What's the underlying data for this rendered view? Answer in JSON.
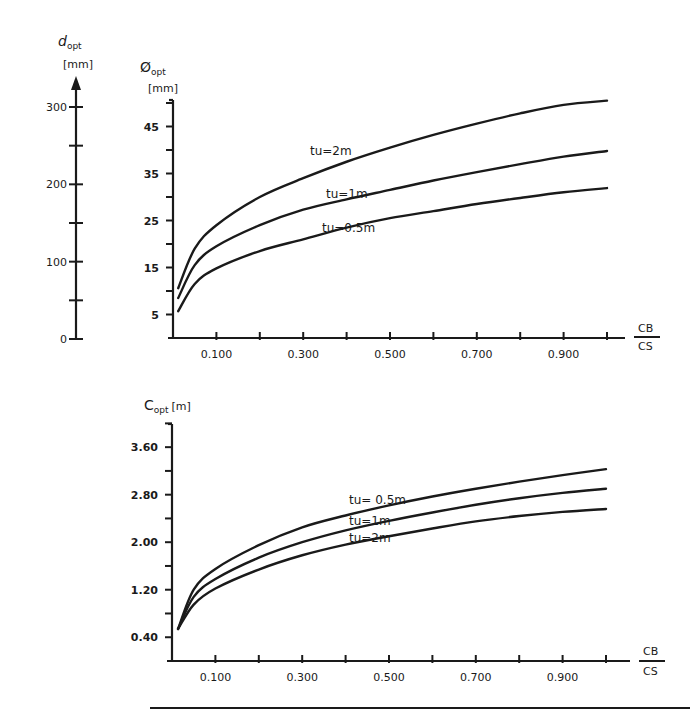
{
  "chart_data": [
    {
      "type": "line",
      "title": "",
      "xlabel": "C_B / C_S",
      "ylabel": "Ø_opt [mm]",
      "secondary_ylabel": "d_opt [mm]",
      "secondary_yticks": [
        "0",
        "100",
        "200",
        "300"
      ],
      "secondary_ylim": [
        0,
        300
      ],
      "xticks": [
        "0.100",
        "0.300",
        "0.500",
        "0.700",
        "0.900"
      ],
      "yticks": [
        "5",
        "15",
        "25",
        "35",
        "45"
      ],
      "xlim": [
        0,
        1.0
      ],
      "ylim": [
        0,
        50
      ],
      "grid": false,
      "legend": "inline curve labels",
      "x": [
        0.012,
        0.05,
        0.1,
        0.2,
        0.3,
        0.4,
        0.5,
        0.6,
        0.7,
        0.8,
        0.9,
        1.0
      ],
      "series": [
        {
          "name": "tu=2m",
          "label": "tu=2m",
          "values": [
            10.6,
            19.0,
            24.0,
            30.0,
            34.0,
            37.5,
            40.5,
            43.2,
            45.6,
            47.8,
            49.6,
            50.5
          ]
        },
        {
          "name": "tu=1m",
          "label": "tu=1m",
          "values": [
            8.5,
            15.5,
            19.5,
            24.0,
            27.3,
            29.5,
            31.5,
            33.5,
            35.3,
            37.0,
            38.6,
            39.8
          ]
        },
        {
          "name": "tu=0.5m",
          "label": "tu=0.5m",
          "values": [
            5.7,
            11.5,
            14.8,
            18.5,
            21.0,
            23.5,
            25.5,
            27.0,
            28.5,
            29.8,
            31.0,
            31.9
          ]
        }
      ]
    },
    {
      "type": "line",
      "title": "",
      "xlabel": "C_B / C_S",
      "ylabel": "C_opt [m]",
      "xticks": [
        "0.100",
        "0.300",
        "0.500",
        "0.700",
        "0.900"
      ],
      "yticks": [
        "0.40",
        "1.20",
        "2.00",
        "2.80",
        "3.60"
      ],
      "xlim": [
        0,
        1.0
      ],
      "ylim": [
        0,
        4.0
      ],
      "grid": false,
      "legend": "inline curve labels",
      "x": [
        0.014,
        0.05,
        0.1,
        0.2,
        0.3,
        0.4,
        0.5,
        0.6,
        0.7,
        0.8,
        0.9,
        1.0
      ],
      "series": [
        {
          "name": "tu=0.5m",
          "label": "tu= 0.5m",
          "values": [
            0.54,
            1.2,
            1.55,
            1.95,
            2.25,
            2.45,
            2.62,
            2.77,
            2.9,
            3.02,
            3.13,
            3.23
          ]
        },
        {
          "name": "tu=1m",
          "label": "tu=1m",
          "values": [
            0.54,
            1.08,
            1.38,
            1.74,
            2.0,
            2.2,
            2.36,
            2.5,
            2.63,
            2.74,
            2.83,
            2.9
          ]
        },
        {
          "name": "tu=2m",
          "label": "tu=2m",
          "values": [
            0.54,
            0.95,
            1.22,
            1.54,
            1.78,
            1.96,
            2.1,
            2.23,
            2.35,
            2.44,
            2.51,
            2.56
          ]
        }
      ]
    }
  ],
  "labels": {
    "aux_axis_title": "d",
    "aux_axis_sub": "opt",
    "aux_axis_unit": "[mm]",
    "top_axis_title": "Ø",
    "top_axis_sub": "opt",
    "top_axis_unit": "[mm]",
    "bottom_axis_title": "C",
    "bottom_axis_sub": "opt",
    "bottom_axis_unit": "[m]",
    "frac_num": "CB",
    "frac_den": "CS",
    "top_curve_labels": [
      "tu=2m",
      "tu=1m",
      "tu=0.5m"
    ],
    "bottom_curve_labels": [
      "tu= 0.5m",
      "tu=1m",
      "tu=2m"
    ]
  },
  "colors": {
    "ink": "#1a1a1a",
    "background": "#ffffff"
  }
}
